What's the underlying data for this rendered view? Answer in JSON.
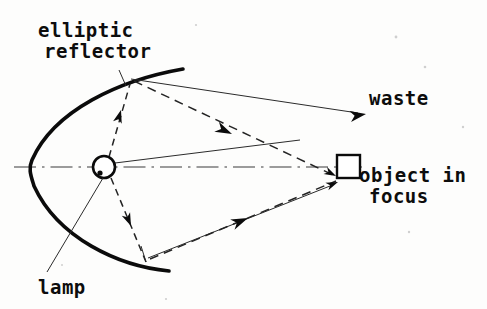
{
  "figure": {
    "background_color": "#fdfdfc",
    "ink_color": "#0b0b0b",
    "width": 487,
    "height": 309
  },
  "labels": {
    "reflector_line1": "elliptic",
    "reflector_line2": "reflector",
    "waste": "waste",
    "object_line1": "object in",
    "object_line2": "focus",
    "lamp": "lamp"
  },
  "components": {
    "reflector": {
      "name": "elliptic reflector",
      "vertex": [
        31,
        167
      ],
      "upper_end": [
        183,
        69
      ],
      "lower_end": [
        169,
        271
      ],
      "stroke_width": 3.6
    },
    "lamp": {
      "name": "lamp at near focus",
      "center": [
        104,
        167
      ],
      "radius": 11,
      "filament_dot": [
        100,
        173
      ]
    },
    "object": {
      "name": "object in focus",
      "rect": [
        337,
        155,
        23,
        23
      ]
    },
    "optical_axis": {
      "name": "optical axis",
      "from": [
        14,
        167
      ],
      "to": [
        362,
        167
      ],
      "style": "dash-dot"
    }
  },
  "rays": [
    {
      "name": "lamp-to-upper-reflector",
      "style": "dashed",
      "from": [
        109,
        157
      ],
      "to": [
        130,
        84
      ],
      "arrow_at": [
        121,
        113
      ],
      "arrow_angle": -74
    },
    {
      "name": "lamp-to-lower-reflector",
      "style": "dashed",
      "from": [
        111,
        178
      ],
      "to": [
        146,
        262
      ],
      "arrow_at": [
        130,
        224
      ],
      "arrow_angle": 67
    },
    {
      "name": "upper-reflector-to-object",
      "style": "dashed",
      "from": [
        134,
        81
      ],
      "to": [
        333,
        175
      ],
      "arrow_at": [
        226,
        131
      ],
      "arrow_angle": 25
    },
    {
      "name": "lower-reflector-to-object",
      "style": "dashed",
      "from": [
        150,
        259
      ],
      "to": [
        336,
        181
      ],
      "arrow_at": [
        244,
        220
      ],
      "arrow_angle": -23
    },
    {
      "name": "upper-stray-to-waste",
      "style": "thin",
      "from": [
        131,
        79
      ],
      "to": [
        366,
        114
      ],
      "arrow_at": [
        360,
        113
      ],
      "arrow_angle": -17
    },
    {
      "name": "lamp-direct-upper",
      "style": "thin",
      "from": [
        115,
        163
      ],
      "to": [
        300,
        140
      ]
    },
    {
      "name": "lower-reflector-stray",
      "style": "thin",
      "from": [
        148,
        258
      ],
      "to": [
        330,
        186
      ]
    }
  ],
  "leaders": [
    {
      "name": "lamp-label-leader",
      "from": [
        103,
        178
      ],
      "to": [
        47,
        272
      ]
    }
  ],
  "text_positions": {
    "reflector_line1": [
      38,
      37
    ],
    "reflector_line2": [
      44,
      58
    ],
    "waste": [
      369,
      105
    ],
    "object_line1": [
      360,
      182
    ],
    "object_line2": [
      370,
      203
    ],
    "lamp": [
      38,
      294
    ]
  }
}
